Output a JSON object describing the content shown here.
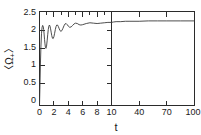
{
  "chart_data": {
    "type": "line",
    "title": "",
    "xlabel": "t",
    "ylabel": "<Ω+>",
    "ylabel_parts": {
      "open_bracket": "〈",
      "symbol": "Ω",
      "subscript": "+",
      "close_bracket": "〉"
    },
    "ylim": [
      0,
      2.5
    ],
    "ytick_labels": [
      "0",
      "0.5",
      "1",
      "1.5",
      "2",
      "2.5"
    ],
    "ytick_values": [
      0,
      0.5,
      1,
      1.5,
      2,
      2.5
    ],
    "grid": false,
    "legend": null,
    "broken_axis": true,
    "panels": [
      {
        "name": "left-panel",
        "xlim": [
          0,
          10
        ],
        "xtick_labels": [
          "0",
          "2",
          "4",
          "6",
          "8",
          "10"
        ],
        "xtick_values": [
          0,
          2,
          4,
          6,
          8,
          10
        ],
        "minor_xticks": [
          1,
          3,
          5,
          7,
          9
        ]
      },
      {
        "name": "right-panel",
        "xlim": [
          10,
          100
        ],
        "xtick_labels": [
          "40",
          "70",
          "100"
        ],
        "xtick_values": [
          40,
          70,
          100
        ],
        "minor_xticks": []
      }
    ],
    "series": [
      {
        "name": "<Ω+>(t)",
        "color": "#3a3a3a",
        "x": [
          0.0,
          0.05,
          0.12,
          0.2,
          0.28,
          0.36,
          0.44,
          0.52,
          0.58,
          0.64,
          0.7,
          0.76,
          0.82,
          0.9,
          0.98,
          1.06,
          1.14,
          1.22,
          1.3,
          1.38,
          1.46,
          1.54,
          1.62,
          1.7,
          1.8,
          1.9,
          2.0,
          2.1,
          2.2,
          2.3,
          2.4,
          2.5,
          2.62,
          2.74,
          2.86,
          2.98,
          3.1,
          3.25,
          3.4,
          3.55,
          3.7,
          3.85,
          4.0,
          4.2,
          4.4,
          4.6,
          4.8,
          5.0,
          5.25,
          5.5,
          5.75,
          6.0,
          6.5,
          7.0,
          7.5,
          8.0,
          8.5,
          9.0,
          9.5,
          10.0,
          12.0,
          15.0,
          20.0,
          25.0,
          30.0,
          40.0,
          50.0,
          60.0,
          70.0,
          85.0,
          100.0
        ],
        "y": [
          0.0,
          0.42,
          1.05,
          1.58,
          1.92,
          2.08,
          2.13,
          2.1,
          2.02,
          1.9,
          1.76,
          1.64,
          1.55,
          1.52,
          1.58,
          1.72,
          1.88,
          2.02,
          2.11,
          2.14,
          2.11,
          2.04,
          1.95,
          1.86,
          1.79,
          1.78,
          1.83,
          1.92,
          2.02,
          2.1,
          2.14,
          2.14,
          2.1,
          2.04,
          1.99,
          1.97,
          1.99,
          2.05,
          2.12,
          2.17,
          2.18,
          2.15,
          2.11,
          2.08,
          2.09,
          2.13,
          2.17,
          2.19,
          2.18,
          2.15,
          2.14,
          2.15,
          2.18,
          2.2,
          2.19,
          2.18,
          2.19,
          2.2,
          2.21,
          2.21,
          2.22,
          2.23,
          2.23,
          2.24,
          2.24,
          2.24,
          2.25,
          2.25,
          2.25,
          2.25,
          2.25
        ]
      }
    ]
  },
  "axis": {
    "x_title": "t",
    "y_title": "<Ω+>"
  }
}
